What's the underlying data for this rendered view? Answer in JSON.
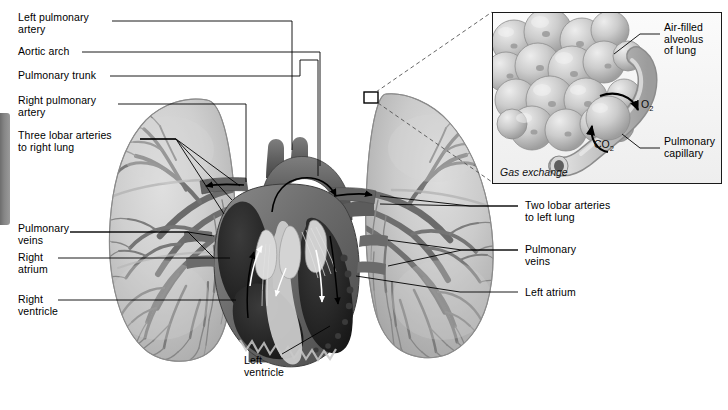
{
  "figure": {
    "background_color": "#ffffff"
  },
  "labels_left": [
    {
      "id": "left-pulmonary-artery",
      "line1": "Left pulmonary",
      "line2": "artery"
    },
    {
      "id": "aortic-arch",
      "line1": "Aortic arch",
      "line2": ""
    },
    {
      "id": "pulmonary-trunk",
      "line1": "Pulmonary trunk",
      "line2": ""
    },
    {
      "id": "right-pulmonary-artery",
      "line1": "Right pulmonary",
      "line2": "artery"
    },
    {
      "id": "three-lobar-arteries",
      "line1": "Three lobar arteries",
      "line2": "to right lung"
    },
    {
      "id": "pulmonary-veins-right",
      "line1": "Pulmonary",
      "line2": "veins"
    },
    {
      "id": "right-atrium",
      "line1": "Right",
      "line2": "atrium"
    },
    {
      "id": "right-ventricle",
      "line1": "Right",
      "line2": "ventricle"
    }
  ],
  "labels_right": [
    {
      "id": "two-lobar-arteries",
      "line1": "Two lobar arteries",
      "line2": "to left lung"
    },
    {
      "id": "pulmonary-veins-left",
      "line1": "Pulmonary",
      "line2": "veins"
    },
    {
      "id": "left-atrium",
      "line1": "Left atrium",
      "line2": ""
    }
  ],
  "labels_center": [
    {
      "id": "left-ventricle",
      "line1": "Left",
      "line2": "ventricle"
    }
  ],
  "inset": {
    "caption": "Gas exchange",
    "labels": [
      {
        "id": "air-filled-alveolus",
        "line1": "Air-filled",
        "line2": "alveolus",
        "line3": "of lung"
      },
      {
        "id": "pulmonary-capillary",
        "line1": "Pulmonary",
        "line2": "capillary",
        "line3": ""
      }
    ],
    "gas_oxygen": "O",
    "gas_oxygen_sub": "2",
    "gas_carbon_dioxide": "CO",
    "gas_carbon_dioxide_sub": "2"
  },
  "colors": {
    "lung_tissue": "#c6c6c6",
    "lung_tissue_light": "#d8d8d8",
    "vessel_gray": "#7e7e7e",
    "vessel_dark": "#646464",
    "heart_muscle": "#6a6a6a",
    "heart_chamber_dark": "#272727",
    "heart_septum_light": "#d2d2d2",
    "great_vessel": "#5e5e5e",
    "alveolus": "#c9c9c9",
    "capillary": "#bdbdbd",
    "leader_line": "#000000",
    "inset_border": "#1a1a1a",
    "inset_background": "#f3f3f3",
    "page_tab": "#858585"
  },
  "bottom_caption": ""
}
